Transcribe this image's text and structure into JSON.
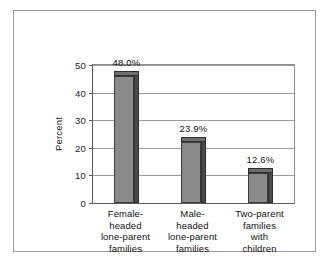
{
  "chart_data": {
    "type": "bar",
    "title": "",
    "subtitle": "",
    "xlabel": "",
    "ylabel": "Percent",
    "ylim": [
      0,
      50
    ],
    "yticks": [
      0,
      10,
      20,
      30,
      40,
      50
    ],
    "ytick_labels": [
      "0",
      "10",
      "20",
      "30",
      "40",
      "50"
    ],
    "grid": true,
    "legend": false,
    "legend_position": "none",
    "categories": [
      "Female-headed lone-parent families",
      "Male-headed lone-parent families",
      "Two-parent families with children"
    ],
    "category_lines": [
      [
        "Female-",
        "headed",
        "lone-parent",
        "families"
      ],
      [
        "Male-",
        "headed",
        "lone-parent",
        "families"
      ],
      [
        "Two-parent",
        "families",
        "with",
        "children"
      ]
    ],
    "values": [
      48.0,
      23.9,
      12.6
    ],
    "value_labels": [
      "48.0%",
      "23.9%",
      "12.6%"
    ],
    "colors": {
      "bar_front": "#8a8a8a",
      "bar_side": "#4a4a4a",
      "bar_top": "#6e6e6e",
      "bar_outline": "#3b3b3b",
      "gridline": "#9b9b9b",
      "axis": "#5a5a5a",
      "frame": "#9a9a9a",
      "background": "#ffffff",
      "text": "#111111"
    }
  }
}
